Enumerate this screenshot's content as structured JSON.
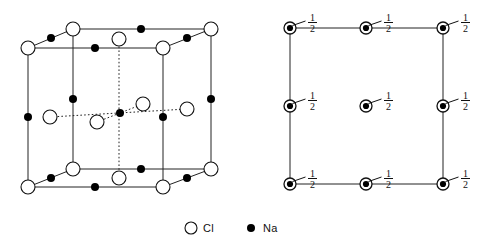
{
  "figure": {
    "colors": {
      "ink": "#111111",
      "line": "#222222",
      "fill_na": "#000000",
      "fill_cl": "#ffffff",
      "background": "#ffffff"
    }
  },
  "legend": {
    "items": [
      {
        "icon": "open-circle-icon",
        "label": "Cl",
        "symbol": "○",
        "x": 191,
        "y": 228
      },
      {
        "icon": "filled-circle-icon",
        "label": "Na",
        "symbol": "●",
        "x": 251,
        "y": 228
      }
    ]
  },
  "left_panel": {
    "name": "unit-cell-3d",
    "caption": "",
    "cube": {
      "front_bottom_left": [
        28,
        187
      ],
      "front_bottom_right": [
        163,
        187
      ],
      "front_top_left": [
        28,
        48
      ],
      "front_top_right": [
        163,
        48
      ],
      "back_bottom_left": [
        73,
        169
      ],
      "back_bottom_right": [
        211,
        169
      ],
      "back_top_left": [
        73,
        29
      ],
      "back_top_right": [
        211,
        29
      ]
    },
    "cl_atoms": [
      {
        "id": "cl-front-top-left",
        "x": 28,
        "y": 48,
        "r": 7
      },
      {
        "id": "cl-front-top-right",
        "x": 163,
        "y": 48,
        "r": 7
      },
      {
        "id": "cl-back-top-left",
        "x": 73,
        "y": 29,
        "r": 7
      },
      {
        "id": "cl-back-top-right",
        "x": 211,
        "y": 29,
        "r": 7
      },
      {
        "id": "cl-top-face-center",
        "x": 119,
        "y": 39,
        "r": 7
      },
      {
        "id": "cl-front-bottom-left",
        "x": 28,
        "y": 187,
        "r": 7
      },
      {
        "id": "cl-front-bottom-right",
        "x": 163,
        "y": 187,
        "r": 7
      },
      {
        "id": "cl-back-bottom-left",
        "x": 73,
        "y": 169,
        "r": 7
      },
      {
        "id": "cl-back-bottom-right",
        "x": 211,
        "y": 169,
        "r": 7
      },
      {
        "id": "cl-bottom-face-center",
        "x": 119,
        "y": 178,
        "r": 7
      },
      {
        "id": "cl-left-face-center",
        "x": 50,
        "y": 117,
        "r": 7
      },
      {
        "id": "cl-right-face-center",
        "x": 187,
        "y": 109,
        "r": 7
      },
      {
        "id": "cl-front-face-center",
        "x": 97,
        "y": 122,
        "r": 7
      },
      {
        "id": "cl-back-face-center",
        "x": 143,
        "y": 104,
        "r": 7
      }
    ],
    "na_atoms": [
      {
        "id": "na-body-center",
        "x": 120,
        "y": 113,
        "r": 4
      },
      {
        "id": "na-edge-front-top",
        "x": 95,
        "y": 48,
        "r": 4
      },
      {
        "id": "na-edge-back-top",
        "x": 141,
        "y": 29,
        "r": 4
      },
      {
        "id": "na-edge-top-left",
        "x": 51,
        "y": 38,
        "r": 4
      },
      {
        "id": "na-edge-top-right",
        "x": 187,
        "y": 38,
        "r": 4
      },
      {
        "id": "na-edge-front-bottom",
        "x": 95,
        "y": 187,
        "r": 4
      },
      {
        "id": "na-edge-back-bottom",
        "x": 141,
        "y": 169,
        "r": 4
      },
      {
        "id": "na-edge-bottom-left",
        "x": 51,
        "y": 178,
        "r": 4
      },
      {
        "id": "na-edge-bottom-right",
        "x": 187,
        "y": 178,
        "r": 4
      },
      {
        "id": "na-vert-front-left",
        "x": 28,
        "y": 117,
        "r": 4
      },
      {
        "id": "na-vert-front-right",
        "x": 163,
        "y": 117,
        "r": 4
      },
      {
        "id": "na-vert-back-left",
        "x": 73,
        "y": 99,
        "r": 4
      },
      {
        "id": "na-vert-back-right",
        "x": 211,
        "y": 99,
        "r": 4
      }
    ]
  },
  "right_panel": {
    "name": "projection-2d",
    "square": {
      "left": 290,
      "top": 28,
      "right": 443,
      "bottom": 184
    },
    "fraction": {
      "numerator": "1",
      "denominator": "2"
    },
    "sites": [
      {
        "id": "site-top-left",
        "x": 290,
        "y": 28,
        "label_x": 308,
        "label_y": 22
      },
      {
        "id": "site-top-center",
        "x": 366,
        "y": 28,
        "label_x": 384,
        "label_y": 22
      },
      {
        "id": "site-top-right",
        "x": 443,
        "y": 28,
        "label_x": 461,
        "label_y": 22
      },
      {
        "id": "site-middle-left",
        "x": 290,
        "y": 106,
        "label_x": 308,
        "label_y": 100
      },
      {
        "id": "site-center",
        "x": 366,
        "y": 106,
        "label_x": 384,
        "label_y": 100
      },
      {
        "id": "site-middle-right",
        "x": 443,
        "y": 106,
        "label_x": 461,
        "label_y": 100
      },
      {
        "id": "site-bottom-left",
        "x": 290,
        "y": 184,
        "label_x": 308,
        "label_y": 178
      },
      {
        "id": "site-bottom-center",
        "x": 366,
        "y": 184,
        "label_x": 384,
        "label_y": 178
      },
      {
        "id": "site-bottom-right",
        "x": 443,
        "y": 184,
        "label_x": 461,
        "label_y": 178
      }
    ]
  }
}
